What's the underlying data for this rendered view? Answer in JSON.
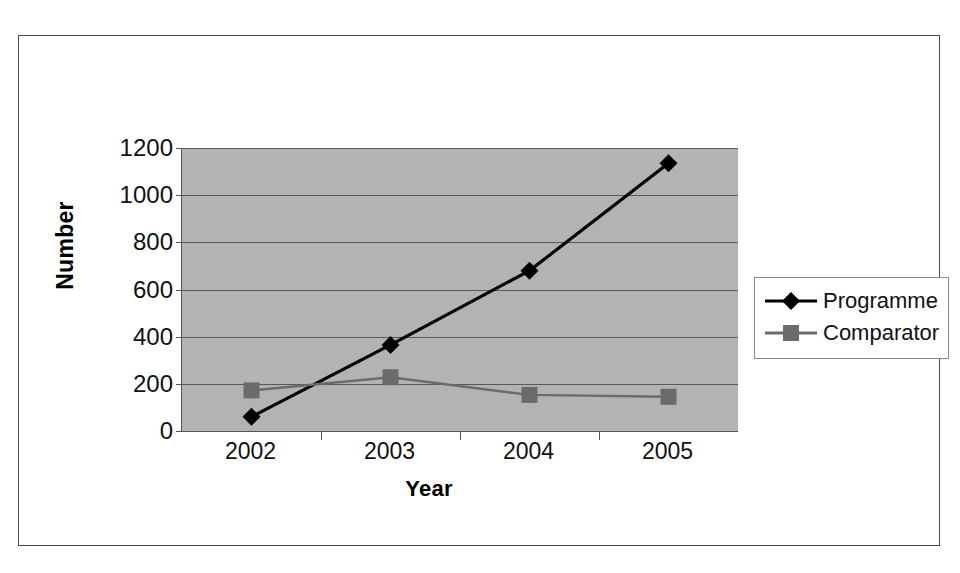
{
  "chart_data": {
    "type": "line",
    "title": "",
    "xlabel": "Year",
    "ylabel": "Number",
    "categories": [
      "2002",
      "2003",
      "2004",
      "2005"
    ],
    "ylim": [
      0,
      1200
    ],
    "yticks": [
      0,
      200,
      400,
      600,
      800,
      1000,
      1200
    ],
    "ytick_labels": [
      "0",
      "200",
      "400",
      "600",
      "800",
      "1000",
      "1200"
    ],
    "grid": true,
    "legend_position": "right",
    "plot_background": "#b3b3b3",
    "series": [
      {
        "name": "Programme",
        "values": [
          60,
          365,
          680,
          1135
        ],
        "color": "#000000",
        "marker": "diamond"
      },
      {
        "name": "Comparator",
        "values": [
          172,
          228,
          153,
          145
        ],
        "color": "#6b6b6b",
        "marker": "square"
      }
    ]
  },
  "legend": {
    "entries": [
      {
        "label": "Programme",
        "marker": "diamond-marker-icon"
      },
      {
        "label": "Comparator",
        "marker": "square-marker-icon"
      }
    ]
  }
}
